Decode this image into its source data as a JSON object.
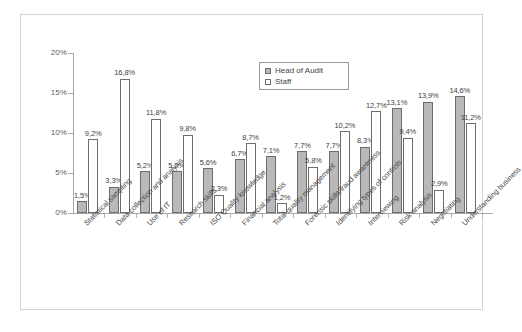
{
  "chart_data": {
    "type": "bar",
    "title": "",
    "subtitle": "",
    "xlabel": "",
    "ylabel": "",
    "ylim": [
      0,
      20
    ],
    "y_ticks": [
      "0%",
      "5%",
      "10%",
      "15%",
      "20%"
    ],
    "y_tick_values": [
      0,
      5,
      10,
      15,
      20
    ],
    "grid": false,
    "legend_position": "top-center",
    "value_label_format": "comma-decimal-percent",
    "categories": [
      "Statistical sampling",
      "Data collection and analysis",
      "Use of IT",
      "Research skills",
      "ISO Quality knowledge",
      "Financial analysis",
      "Total quality management",
      "Forensic skills/fraud awareness",
      "Identifying types of controls",
      "Interviewing",
      "Risk analysis",
      "Negotiating",
      "Understanding business"
    ],
    "series": [
      {
        "name": "Head of Audit",
        "color": "#b9b9b9",
        "values": [
          1.5,
          3.3,
          5.2,
          5.2,
          5.6,
          6.7,
          7.1,
          7.7,
          7.7,
          8.3,
          13.1,
          13.9,
          14.6
        ],
        "labels": [
          "1,5%",
          "3,3%",
          "5,2%",
          "5,2%",
          "5,6%",
          "6,7%",
          "7,1%",
          "7,7%",
          "7,7%",
          "8,3%",
          "13,1%",
          "13,9%",
          "14,6%"
        ]
      },
      {
        "name": "Staff",
        "color": "#ffffff",
        "values": [
          9.2,
          16.8,
          11.8,
          9.8,
          2.3,
          8.7,
          1.2,
          5.8,
          10.2,
          12.7,
          9.4,
          2.9,
          11.2
        ],
        "labels": [
          "9,2%",
          "16,8%",
          "11,8%",
          "9,8%",
          "2,3%",
          "8,7%",
          "1,2%",
          "5,8%",
          "10,2%",
          "12,7%",
          "9,4%",
          "2,9%",
          "11,2%"
        ]
      }
    ]
  },
  "legend": {
    "entries": [
      {
        "label": "Head of Audit",
        "swatch": "head"
      },
      {
        "label": "Staff",
        "swatch": "staff"
      }
    ]
  }
}
